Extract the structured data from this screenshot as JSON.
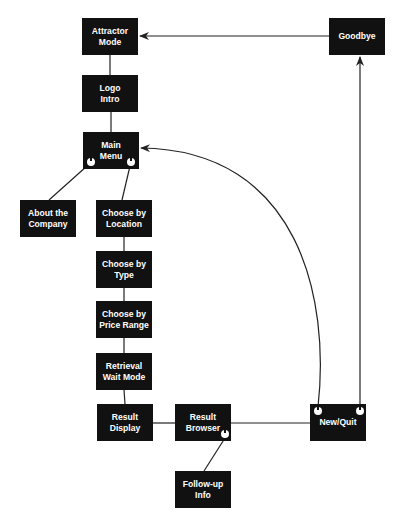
{
  "diagram": {
    "type": "flowchart",
    "colors": {
      "node_fill": "#111111",
      "node_text": "#ffffff",
      "line": "#222222",
      "background": "#ffffff"
    },
    "nodes": [
      {
        "id": "attractor",
        "label": "Attractor\nMode"
      },
      {
        "id": "logo",
        "label": "Logo\nIntro"
      },
      {
        "id": "main",
        "label": "Main\nMenu"
      },
      {
        "id": "about",
        "label": "About the\nCompany"
      },
      {
        "id": "location",
        "label": "Choose by\nLocation"
      },
      {
        "id": "type",
        "label": "Choose by\nType"
      },
      {
        "id": "price",
        "label": "Choose by\nPrice Range"
      },
      {
        "id": "retrieval",
        "label": "Retrieval\nWait Mode"
      },
      {
        "id": "display",
        "label": "Result\nDisplay"
      },
      {
        "id": "browser",
        "label": "Result\nBrowser"
      },
      {
        "id": "newquit",
        "label": "New/Quit"
      },
      {
        "id": "goodbye",
        "label": "Goodbye"
      },
      {
        "id": "followup",
        "label": "Follow-up\nInfo"
      }
    ],
    "edges": [
      {
        "from": "attractor",
        "to": "logo",
        "arrow": false
      },
      {
        "from": "logo",
        "to": "main",
        "arrow": false
      },
      {
        "from": "main",
        "to": "about",
        "arrow": false
      },
      {
        "from": "main",
        "to": "location",
        "arrow": false
      },
      {
        "from": "location",
        "to": "type",
        "arrow": false
      },
      {
        "from": "type",
        "to": "price",
        "arrow": false
      },
      {
        "from": "price",
        "to": "retrieval",
        "arrow": false
      },
      {
        "from": "retrieval",
        "to": "display",
        "arrow": false
      },
      {
        "from": "display",
        "to": "browser",
        "arrow": false
      },
      {
        "from": "browser",
        "to": "newquit",
        "arrow": false
      },
      {
        "from": "browser",
        "to": "followup",
        "arrow": false
      },
      {
        "from": "newquit",
        "to": "main",
        "arrow": true
      },
      {
        "from": "newquit",
        "to": "goodbye",
        "arrow": true
      },
      {
        "from": "goodbye",
        "to": "attractor",
        "arrow": true
      }
    ]
  }
}
